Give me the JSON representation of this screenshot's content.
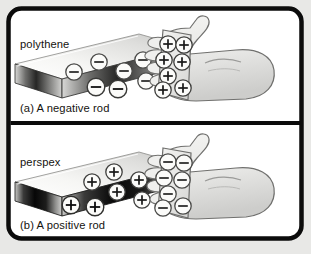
{
  "figure": {
    "title_present": false,
    "background_color": "#e8e8e6",
    "frame_color": "#000000",
    "panel_background": "#ffffff",
    "panels": [
      {
        "id": "panel-a",
        "material_label": "polythene",
        "caption": "(a) A negative rod",
        "rod": {
          "material": "polythene",
          "charge_sign": "−",
          "charge_symbol_name": "minus-charge",
          "charge_count": 6,
          "top_face_color": "#f2f2f0",
          "front_face_color": "#2a2a2a",
          "side_face_color": "#cfcfcd"
        },
        "plate": {
          "charge_sign": "+",
          "charge_symbol_name": "plus-charge",
          "charge_count": 8,
          "fill_color": "#e9e9e7"
        },
        "hand": {
          "label": "hand",
          "fill_color": "#ededeb",
          "outline_color": "#6b6b69"
        }
      },
      {
        "id": "panel-b",
        "material_label": "perspex",
        "caption": "(b) A positive rod",
        "rod": {
          "material": "perspex",
          "charge_sign": "+",
          "charge_symbol_name": "plus-charge",
          "charge_count": 6,
          "top_face_color": "#f2f2f0",
          "front_face_color": "#111111",
          "side_face_color": "#cfcfcd"
        },
        "plate": {
          "charge_sign": "−",
          "charge_symbol_name": "minus-charge",
          "charge_count": 8,
          "fill_color": "#e9e9e7"
        },
        "hand": {
          "label": "hand",
          "fill_color": "#ededeb",
          "outline_color": "#6b6b69"
        }
      }
    ]
  }
}
